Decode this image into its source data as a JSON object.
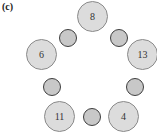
{
  "figure": {
    "panel_label": "(c)",
    "large_nodes": [
      {
        "id": "n8",
        "value": "8",
        "cx": 93,
        "cy": 17
      },
      {
        "id": "n13",
        "value": "13",
        "cx": 143,
        "cy": 55
      },
      {
        "id": "n4",
        "value": "4",
        "cx": 124,
        "cy": 117
      },
      {
        "id": "n11",
        "value": "11",
        "cx": 60,
        "cy": 117
      },
      {
        "id": "n6",
        "value": "6",
        "cx": 42,
        "cy": 55
      }
    ],
    "small_nodes": [
      {
        "id": "s1",
        "cx": 119,
        "cy": 38
      },
      {
        "id": "s2",
        "cx": 135,
        "cy": 87
      },
      {
        "id": "s3",
        "cx": 92,
        "cy": 117
      },
      {
        "id": "s4",
        "cx": 52,
        "cy": 87
      },
      {
        "id": "s5",
        "cx": 68,
        "cy": 38
      }
    ],
    "colors": {
      "large_fill": "#dcdcdc",
      "large_border": "#8a8a8a",
      "small_fill": "#c8c8c8",
      "small_border": "#3e3e3e"
    }
  }
}
